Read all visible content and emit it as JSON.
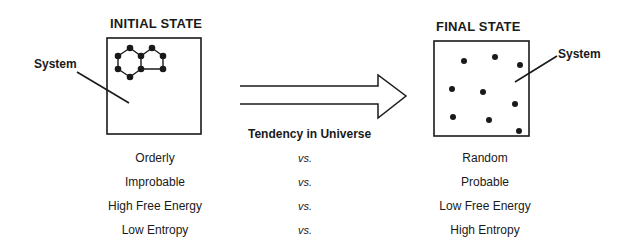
{
  "initial": {
    "title": "INITIAL STATE",
    "system_label": "System"
  },
  "final": {
    "title": "FINAL STATE",
    "system_label": "System"
  },
  "arrow": {
    "label": "Tendency in Universe"
  },
  "comparisons": [
    {
      "left": "Orderly",
      "sep": "vs.",
      "right": "Random"
    },
    {
      "left": "Improbable",
      "sep": "vs.",
      "right": "Probable"
    },
    {
      "left": "High Free Energy",
      "sep": "vs.",
      "right": "Low Free Energy"
    },
    {
      "left": "Low Entropy",
      "sep": "vs.",
      "right": "High Entropy"
    }
  ],
  "colors": {
    "ink": "#1a1a1a",
    "background": "#ffffff"
  }
}
